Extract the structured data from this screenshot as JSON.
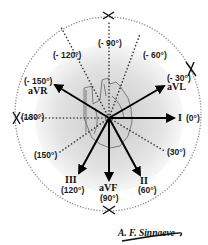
{
  "center": {
    "x": 109,
    "y": 118
  },
  "outer_circle": {
    "rx": 93,
    "ry": 96,
    "style": "dotted"
  },
  "inner_disc": {
    "r": 72,
    "color": "#d9d9d9"
  },
  "leads": [
    {
      "id": "I",
      "name": "I",
      "angle_label": "(0°)",
      "angle": 0
    },
    {
      "id": "II",
      "name": "II",
      "angle_label": "(60°)",
      "angle": 60
    },
    {
      "id": "aVF",
      "name": "aVF",
      "angle_label": "(90°)",
      "angle": 90
    },
    {
      "id": "III",
      "name": "III",
      "angle_label": "(120°)",
      "angle": 120
    },
    {
      "id": "aVR",
      "name": "aVR",
      "angle_label": "(- 150°)",
      "angle": -150
    },
    {
      "id": "aVL",
      "name": "aVL",
      "angle_label": "(- 30°)",
      "angle": -30
    }
  ],
  "dotted_axes": [
    {
      "angle_label": "(30°)",
      "angle": 30
    },
    {
      "angle_label": "(150°)",
      "angle": 150
    },
    {
      "angle_label": "(180°)",
      "angle": 180
    },
    {
      "angle_label": "(- 120°)",
      "angle": -120
    },
    {
      "angle_label": "(- 90°)",
      "angle": -90
    },
    {
      "angle_label": "(- 60°)",
      "angle": -60
    }
  ],
  "cross_marks": [
    "top",
    "left",
    "bottom",
    "upper-right"
  ],
  "signature": "A. F. Sinnaeve",
  "colors": {
    "arrow": "#000000",
    "dots": "#333333",
    "circle": "#888888",
    "heart_outline": "#777777"
  }
}
